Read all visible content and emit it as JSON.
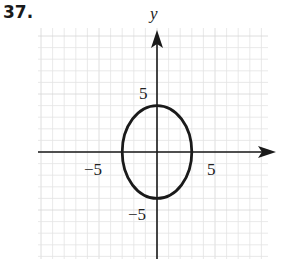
{
  "problem": {
    "number": "37."
  },
  "chart_data": {
    "type": "line",
    "title": "",
    "equation": "x^2/9 + y^2/16 = 1",
    "series": [
      {
        "name": "ellipse",
        "center": [
          0,
          0
        ],
        "semi_axis_x": 3,
        "semi_axis_y": 4,
        "key_points": [
          [
            3,
            0
          ],
          [
            0,
            4
          ],
          [
            -3,
            0
          ],
          [
            0,
            -4
          ]
        ]
      }
    ],
    "xlabel": "",
    "ylabel": "y",
    "xlim": [
      -10,
      10
    ],
    "ylim": [
      -10,
      10
    ],
    "x_ticks": [
      {
        "value": -5,
        "label": "−5"
      },
      {
        "value": 5,
        "label": "5"
      }
    ],
    "y_ticks": [
      {
        "value": 5,
        "label": "5"
      },
      {
        "value": -5,
        "label": "−5"
      }
    ],
    "grid": true,
    "legend": null
  },
  "colors": {
    "curve": "#1a1a1a",
    "axis": "#1a1a1a",
    "grid": "#e3e3e3",
    "grid_major": "#d6d6d6"
  }
}
